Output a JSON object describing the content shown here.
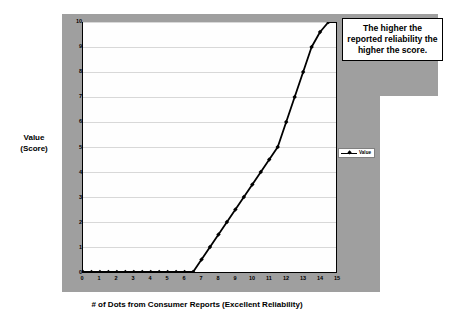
{
  "chart_data": {
    "type": "line",
    "title": "",
    "xlabel": "# of Dots from Consumer Reports (Excellent Reliability)",
    "ylabel": "Value (Score)",
    "ylabel_line1": "Value",
    "ylabel_line2": "(Score)",
    "xlim": [
      0,
      15
    ],
    "ylim": [
      0,
      10
    ],
    "xticks": [
      "0",
      "1",
      "2",
      "3",
      "4",
      "5",
      "6",
      "7",
      "8",
      "9",
      "10",
      "11",
      "12",
      "13",
      "14",
      "15"
    ],
    "yticks": [
      "10",
      "9",
      "8",
      "7",
      "6",
      "5",
      "4",
      "3",
      "2",
      "1",
      "0"
    ],
    "grid": "horizontal",
    "legend_position": "right",
    "series": [
      {
        "name": "Value",
        "marker": "diamond",
        "color": "#000000",
        "x": [
          0,
          0.5,
          1,
          1.5,
          2,
          2.5,
          3,
          3.5,
          4,
          4.5,
          5,
          5.5,
          6,
          6.5,
          7,
          7.5,
          8,
          8.5,
          9,
          9.5,
          10,
          10.5,
          11,
          11.5,
          12,
          12.5,
          13,
          13.5,
          14,
          14.5,
          15
        ],
        "values": [
          0,
          0,
          0,
          0,
          0,
          0,
          0,
          0,
          0,
          0,
          0,
          0,
          0,
          0,
          0.5,
          1,
          1.5,
          2,
          2.5,
          3,
          3.5,
          4,
          4.5,
          5,
          6,
          7,
          8,
          9,
          9.6,
          10,
          10
        ]
      }
    ]
  },
  "legend": {
    "entries": [
      {
        "label": "Value"
      }
    ]
  },
  "callout": {
    "text": "The higher the reported reliability the higher the score."
  }
}
